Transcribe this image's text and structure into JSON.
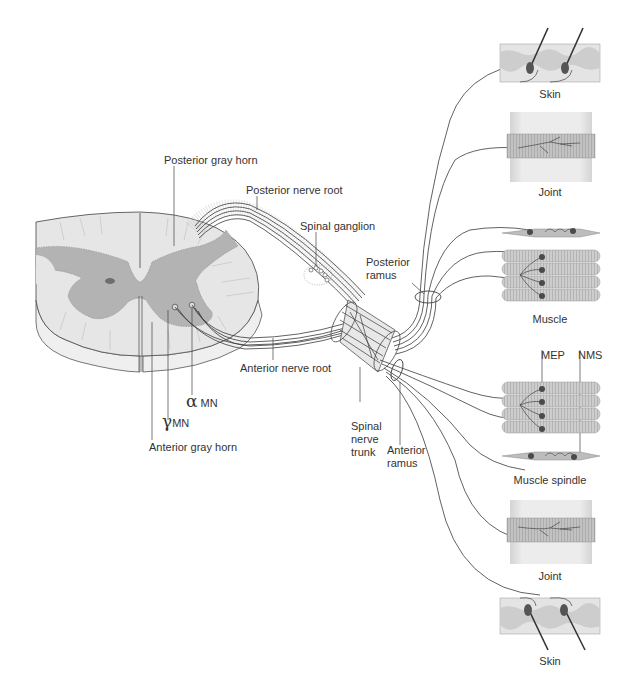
{
  "figure": {
    "colors": {
      "white_matter": "#e6e6e6",
      "gray_matter": "#b3b3b3",
      "central_canal": "#6e6e6e",
      "nerve_line": "#3a3a3a",
      "muscle_fiber": "#c8c8c8",
      "nerve_ending_dot": "#4a4a4a",
      "skin_epidermis": "#d9d9d9",
      "skin_dermis": "#cfcfcf",
      "joint": "#c4c4c4",
      "label_text": "#333333"
    }
  },
  "labels": {
    "posterior_gray_horn": "Posterior gray horn",
    "posterior_nerve_root": "Posterior nerve root",
    "spinal_ganglion": "Spinal ganglion",
    "posterior_ramus_line1": "Posterior",
    "posterior_ramus_line2": "ramus",
    "anterior_nerve_root": "Anterior nerve root",
    "alpha_symbol": "α",
    "alpha_mn": "MN",
    "gamma_symbol": "γ",
    "gamma_mn": "MN",
    "anterior_gray_horn": "Anterior gray horn",
    "spinal_nerve_trunk_line1": "Spinal",
    "spinal_nerve_trunk_line2": "nerve",
    "spinal_nerve_trunk_line3": "trunk",
    "anterior_ramus_line1": "Anterior",
    "anterior_ramus_line2": "ramus",
    "mep": "MEP",
    "nms": "NMS"
  },
  "panels": {
    "top": [
      {
        "id": "skin-top",
        "caption": "Skin"
      },
      {
        "id": "joint-top",
        "caption": "Joint"
      },
      {
        "id": "muscle-top",
        "caption": "Muscle"
      }
    ],
    "bottom": [
      {
        "id": "muscle-spindle-bottom",
        "caption": "Muscle spindle"
      },
      {
        "id": "joint-bottom",
        "caption": "Joint"
      },
      {
        "id": "skin-bottom",
        "caption": "Skin"
      }
    ]
  }
}
